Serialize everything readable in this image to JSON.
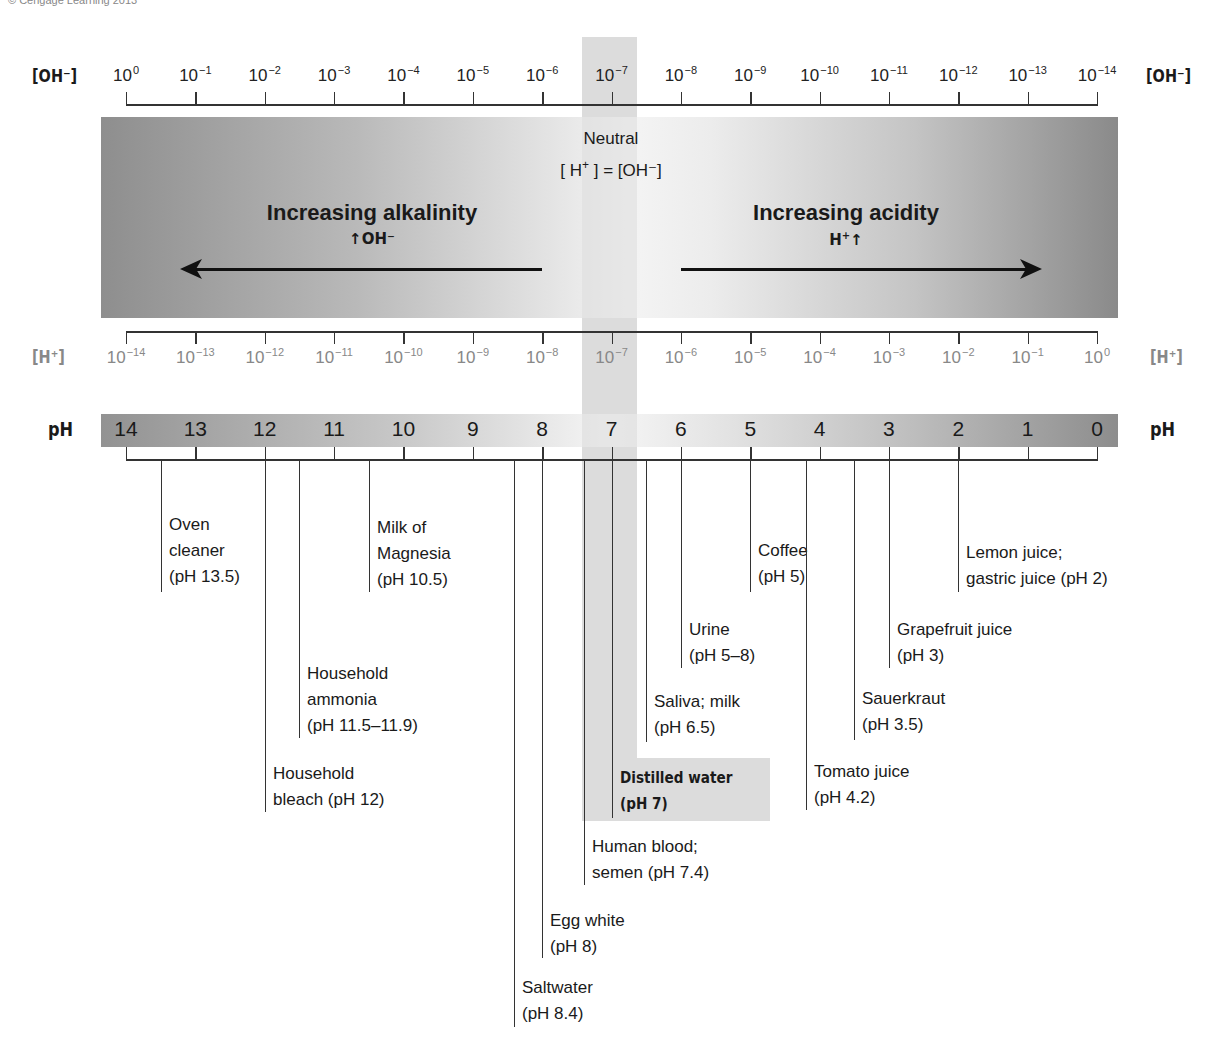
{
  "credit": "© Cengage Learning 2013",
  "colors": {
    "ink": "#1a1a1a",
    "grey_text": "#888888",
    "neutral_band": "#dcdcdc"
  },
  "oh_axis": {
    "label_left": "[OH⁻]",
    "label_right": "[OH⁻]",
    "ticks": [
      {
        "base": "10",
        "exp": "0"
      },
      {
        "base": "10",
        "exp": "−1"
      },
      {
        "base": "10",
        "exp": "−2"
      },
      {
        "base": "10",
        "exp": "−3"
      },
      {
        "base": "10",
        "exp": "−4"
      },
      {
        "base": "10",
        "exp": "−5"
      },
      {
        "base": "10",
        "exp": "−6"
      },
      {
        "base": "10",
        "exp": "−7"
      },
      {
        "base": "10",
        "exp": "−8"
      },
      {
        "base": "10",
        "exp": "−9"
      },
      {
        "base": "10",
        "exp": "−10"
      },
      {
        "base": "10",
        "exp": "−11"
      },
      {
        "base": "10",
        "exp": "−12"
      },
      {
        "base": "10",
        "exp": "−13"
      },
      {
        "base": "10",
        "exp": "−14"
      }
    ]
  },
  "band": {
    "neutral_title": "Neutral",
    "neutral_eq_pre": "[ H",
    "neutral_eq_sup": "+",
    "neutral_eq_post": " ] = [OH⁻]",
    "alkalinity_title": "Increasing alkalinity",
    "alkalinity_sub_arrow": "↑",
    "alkalinity_sub": "OH⁻",
    "acidity_title": "Increasing acidity",
    "acidity_sub": "H",
    "acidity_sub_sup": "+",
    "acidity_sub_arrow": "↑"
  },
  "h_axis": {
    "label_left": "[H⁺]",
    "label_right": "[H⁺]",
    "ticks": [
      {
        "base": "10",
        "exp": "−14"
      },
      {
        "base": "10",
        "exp": "−13"
      },
      {
        "base": "10",
        "exp": "−12"
      },
      {
        "base": "10",
        "exp": "−11"
      },
      {
        "base": "10",
        "exp": "−10"
      },
      {
        "base": "10",
        "exp": "−9"
      },
      {
        "base": "10",
        "exp": "−8"
      },
      {
        "base": "10",
        "exp": "−7"
      },
      {
        "base": "10",
        "exp": "−6"
      },
      {
        "base": "10",
        "exp": "−5"
      },
      {
        "base": "10",
        "exp": "−4"
      },
      {
        "base": "10",
        "exp": "−3"
      },
      {
        "base": "10",
        "exp": "−2"
      },
      {
        "base": "10",
        "exp": "−1"
      },
      {
        "base": "10",
        "exp": "0"
      }
    ]
  },
  "ph_scale": {
    "label_left": "pH",
    "label_right": "pH",
    "values": [
      "14",
      "13",
      "12",
      "11",
      "10",
      "9",
      "8",
      "7",
      "6",
      "5",
      "4",
      "3",
      "2",
      "1",
      "0"
    ]
  },
  "substances": [
    {
      "name": "oven-cleaner",
      "lines": [
        "Oven",
        "cleaner",
        "(pH 13.5)"
      ],
      "ph": 13.5
    },
    {
      "name": "household-bleach",
      "lines": [
        "Household",
        "bleach (pH 12)"
      ],
      "ph": 12
    },
    {
      "name": "household-ammonia",
      "lines": [
        "Household",
        "ammonia",
        "(pH 11.5–11.9)"
      ],
      "ph": 11.5
    },
    {
      "name": "milk-of-magnesia",
      "lines": [
        "Milk of",
        "Magnesia",
        "(pH 10.5)"
      ],
      "ph": 10.5
    },
    {
      "name": "saltwater",
      "lines": [
        "Saltwater",
        "(pH 8.4)"
      ],
      "ph": 8.4
    },
    {
      "name": "egg-white",
      "lines": [
        "Egg white",
        "(pH 8)"
      ],
      "ph": 8
    },
    {
      "name": "human-blood",
      "lines": [
        "Human blood;",
        "semen (pH 7.4)"
      ],
      "ph": 7.4
    },
    {
      "name": "distilled-water",
      "lines": [
        "Distilled water",
        "(pH 7)"
      ],
      "ph": 7
    },
    {
      "name": "saliva-milk",
      "lines": [
        "Saliva; milk",
        "(pH 6.5)"
      ],
      "ph": 6.5
    },
    {
      "name": "urine",
      "lines": [
        "Urine",
        "(pH 5–8)"
      ],
      "ph": 6
    },
    {
      "name": "coffee",
      "lines": [
        "Coffee",
        "(pH 5)"
      ],
      "ph": 5
    },
    {
      "name": "tomato-juice",
      "lines": [
        "Tomato juice",
        "(pH 4.2)"
      ],
      "ph": 4.2
    },
    {
      "name": "sauerkraut",
      "lines": [
        "Sauerkraut",
        "(pH 3.5)"
      ],
      "ph": 3.5
    },
    {
      "name": "grapefruit-juice",
      "lines": [
        "Grapefruit juice",
        "(pH 3)"
      ],
      "ph": 3
    },
    {
      "name": "lemon-juice",
      "lines": [
        "Lemon juice;",
        "gastric juice (pH 2)"
      ],
      "ph": 2
    }
  ]
}
